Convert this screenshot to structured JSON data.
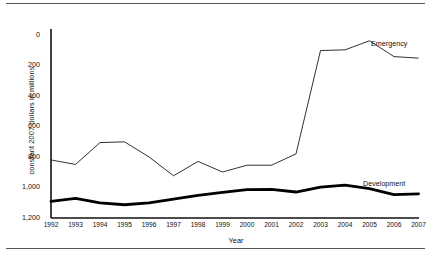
{
  "figure": {
    "ylabel": "constant 2007 dollars in millions",
    "xlabel": "Year"
  },
  "yticks": [
    "0",
    "200",
    "400",
    "600",
    "800",
    "1,000",
    "1,200"
  ],
  "series_labels": {
    "emergency": "Emergency",
    "development": "Development"
  },
  "chart_data": {
    "type": "line",
    "title": "",
    "xlabel": "Year",
    "ylabel": "constant 2007 dollars in millions",
    "x": [
      1992,
      1993,
      1994,
      1995,
      1996,
      1997,
      1998,
      1999,
      2000,
      2001,
      2002,
      2003,
      2004,
      2005,
      2006,
      2007
    ],
    "categories": [
      "1992",
      "1993",
      "1994",
      "1995",
      "1996",
      "1997",
      "1998",
      "1999",
      "2000",
      "2001",
      "2002",
      "2003",
      "2004",
      "2005",
      "2006",
      "2007"
    ],
    "xlim": [
      1992,
      2007
    ],
    "ylim": [
      0,
      1200
    ],
    "yticks": [
      0,
      200,
      400,
      600,
      800,
      1000,
      1200
    ],
    "grid": false,
    "legend": "inline-right-of-line-end",
    "series": [
      {
        "name": "Emergency",
        "values": [
          385,
          355,
          500,
          505,
          405,
          280,
          375,
          305,
          350,
          350,
          425,
          1110,
          1115,
          1175,
          1070,
          1060
        ],
        "line_width": 1,
        "color": "#1a1a1a"
      },
      {
        "name": "Development",
        "values": [
          110,
          130,
          100,
          88,
          100,
          125,
          150,
          170,
          188,
          190,
          172,
          205,
          218,
          195,
          155,
          160
        ],
        "line_width": 3,
        "color": "#000000"
      }
    ],
    "annotations": [
      {
        "text": "Emergency",
        "x": 2007,
        "y": 1155
      },
      {
        "text": "Development",
        "x": 2007,
        "y": 255
      }
    ]
  }
}
